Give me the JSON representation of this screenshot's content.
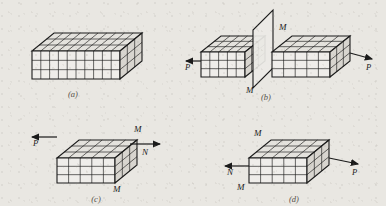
{
  "figure": {
    "background_color": "#e9e7e2",
    "ink_color": "#1a1a1a",
    "face_top_color": "#e4e2dd",
    "face_front_color": "#efedea",
    "face_side_color": "#d8d5cf",
    "plane_fill_color": "#eceae6"
  },
  "panels": [
    {
      "id": "a",
      "caption": "(a)",
      "description": "Intact rectangular block of unit cells",
      "grid": {
        "columns": 10,
        "rows": 3,
        "depth": 3
      },
      "labels": [],
      "arrows": []
    },
    {
      "id": "b",
      "caption": "(b)",
      "description": "Block separated along plane M, pulled apart by forces P",
      "grid": {
        "columns": 5,
        "rows": 3,
        "depth": 3
      },
      "labels": [
        {
          "text": "M",
          "position": "plane-top-right"
        },
        {
          "text": "M",
          "position": "plane-bottom-left"
        }
      ],
      "arrows": [
        {
          "text": "P",
          "direction": "left",
          "position": "left"
        },
        {
          "text": "P",
          "direction": "right",
          "position": "right"
        }
      ]
    },
    {
      "id": "c",
      "caption": "(c)",
      "description": "Left half block with plane M on its right face and plane N",
      "grid": {
        "columns": 5,
        "rows": 3,
        "depth": 3
      },
      "labels": [
        {
          "text": "M",
          "position": "top-right"
        },
        {
          "text": "N",
          "position": "right-lower"
        },
        {
          "text": "M",
          "position": "bottom-center"
        }
      ],
      "arrows": [
        {
          "text": "P",
          "direction": "left",
          "position": "left"
        },
        {
          "text": "",
          "direction": "right",
          "position": "right"
        }
      ]
    },
    {
      "id": "d",
      "caption": "(d)",
      "description": "Right half block with plane M on its left face",
      "grid": {
        "columns": 5,
        "rows": 3,
        "depth": 3
      },
      "labels": [
        {
          "text": "M",
          "position": "top-left"
        },
        {
          "text": "M",
          "position": "bottom-left"
        }
      ],
      "arrows": [
        {
          "text": "N",
          "direction": "left",
          "position": "left"
        },
        {
          "text": "P",
          "direction": "right",
          "position": "right"
        }
      ]
    }
  ],
  "captions": {
    "a": "(a)",
    "b": "(b)",
    "c": "(c)",
    "d": "(d)"
  },
  "label_text": {
    "M": "M",
    "N": "N",
    "P": "P"
  }
}
